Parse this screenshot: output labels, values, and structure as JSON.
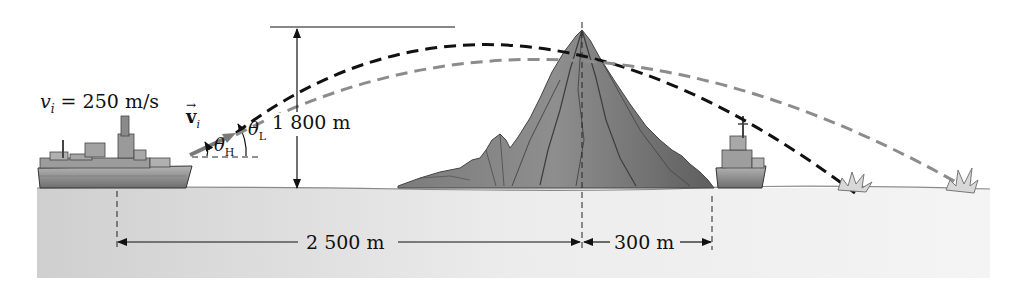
{
  "figure": {
    "velocity_label": "v",
    "velocity_subscript": "i",
    "velocity_value": " = 250 m/s",
    "vector_label": "v",
    "vector_subscript": "i",
    "theta_high": "θ",
    "theta_high_sub": "H",
    "theta_low": "θ",
    "theta_low_sub": "L",
    "height_label": "1 800 m",
    "distance_to_peak_label": "2 500 m",
    "distance_beyond_peak_label": "300 m"
  },
  "colors": {
    "high_trajectory": "#111111",
    "low_trajectory": "#8c8c8c",
    "water": "#e4e4e4",
    "mountain": "#6f6f6f",
    "ship": "#8a8a8a"
  }
}
